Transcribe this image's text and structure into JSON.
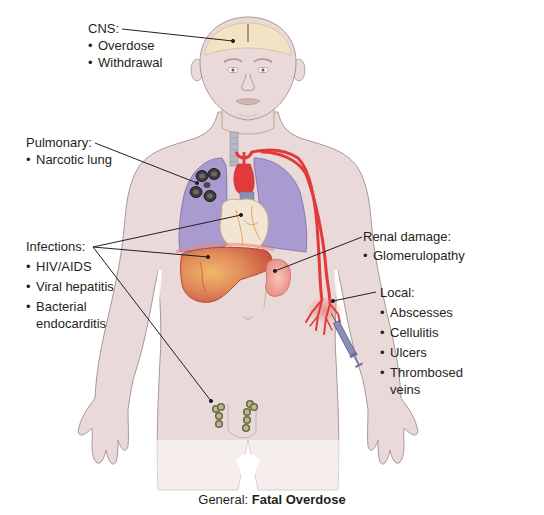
{
  "diagram": {
    "type": "anatomical-illustration"
  },
  "labels": {
    "cns": {
      "title": "CNS:",
      "items": [
        "Overdose",
        "Withdrawal"
      ]
    },
    "pulmonary": {
      "title": "Pulmonary:",
      "items": [
        "Narcotic lung"
      ]
    },
    "infections": {
      "title": "Infections:",
      "items": [
        "HIV/AIDS",
        "Viral hepatitis",
        "Bacterial endocarditis"
      ]
    },
    "renal": {
      "title": "Renal damage:",
      "items": [
        "Glomerulopathy"
      ]
    },
    "local": {
      "title": "Local:",
      "items": [
        "Abscesses",
        "Cellulitis",
        "Ulcers",
        "Thrombosed veins"
      ]
    }
  },
  "caption": {
    "prefix": "General:",
    "emphasis": "Fatal Overdose"
  },
  "colors": {
    "skin": "#e9d9d8",
    "skin_outline": "#a89896",
    "brain": "#f3e2c4",
    "lungs": "#a99ad0",
    "lung_lesion": "#3c3c3c",
    "heart": "#f2e5d4",
    "artery": "#e23a3a",
    "liver": "#d96a4e",
    "kidney": "#f0a59a",
    "syringe": "#8a8fb8",
    "leader_line": "#231f20"
  }
}
